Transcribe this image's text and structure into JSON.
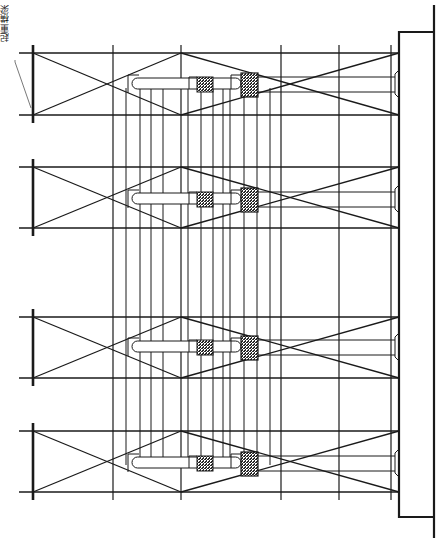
{
  "drawing": {
    "label": "起重横梁",
    "colors": {
      "line": "#1a1a1a",
      "background": "#ffffff",
      "hatch": "#2a2a2a"
    },
    "leader": {
      "points": [
        [
          15,
          60
        ],
        [
          15,
          62
        ],
        [
          31,
          108
        ]
      ]
    },
    "main_verticals": [
      {
        "x": 113,
        "y1": 45,
        "y2": 500,
        "w": 1.2
      },
      {
        "x": 181,
        "y1": 45,
        "y2": 500,
        "w": 1.2
      },
      {
        "x": 281,
        "y1": 45,
        "y2": 500,
        "w": 1.2
      },
      {
        "x": 339,
        "y1": 45,
        "y2": 500,
        "w": 1.2
      },
      {
        "x": 391,
        "y1": 45,
        "y2": 500,
        "w": 1.2
      }
    ],
    "secondary_verticals": {
      "xs": [
        126,
        140,
        151,
        163,
        188,
        201,
        213,
        223,
        230,
        244,
        257,
        270
      ],
      "y1": 88,
      "y2": 465,
      "w": 1
    },
    "right_frame": {
      "inner_x": 399,
      "outer_x": 434,
      "top_y": 32,
      "bottom_y": 517,
      "outer_y1": 5,
      "outer_y2": 538
    },
    "bays": [
      {
        "top": 53,
        "bottom": 115,
        "capsule_y": 78,
        "capsule_h": 11,
        "box_small_y": 77,
        "box_big_y": 73
      },
      {
        "top": 167,
        "bottom": 228,
        "capsule_y": 193,
        "capsule_h": 11,
        "box_small_y": 192,
        "box_big_y": 188
      },
      {
        "top": 317,
        "bottom": 378,
        "capsule_y": 341,
        "capsule_h": 11,
        "box_small_y": 340,
        "box_big_y": 336
      },
      {
        "top": 431,
        "bottom": 492,
        "capsule_y": 457,
        "capsule_h": 11,
        "box_small_y": 456,
        "box_big_y": 452
      }
    ],
    "bay_geometry": {
      "left_x": 33,
      "beam_start_x": 19,
      "mid_x": 181,
      "right_x": 399,
      "post_extend": 8,
      "capsule_x1": 132,
      "capsule_x2": 241,
      "small_box": {
        "x": 197,
        "w": 16,
        "h": 15
      },
      "big_box": {
        "x": 241,
        "w": 17,
        "h": 24
      },
      "rail_x2": 396,
      "bracket": {
        "x": 395,
        "w": 4,
        "h": 28
      }
    }
  }
}
